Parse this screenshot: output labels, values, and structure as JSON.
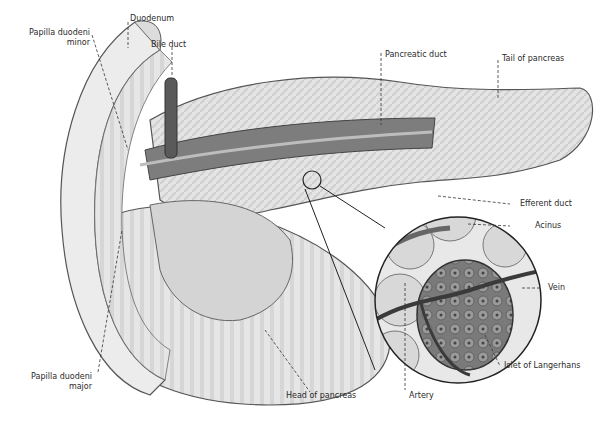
{
  "diagram": {
    "labels": {
      "duodenum": "Duodenum",
      "papilla_minor_line1": "Papilla duodeni",
      "papilla_minor_line2": "minor",
      "bile_duct": "Bile duct",
      "pancreatic_duct": "Pancreatic duct",
      "tail_of_pancreas": "Tail of pancreas",
      "efferent_duct": "Efferent duct",
      "acinus": "Acinus",
      "vein": "Vein",
      "islet_of_langerhans": "Islet of Langerhans",
      "artery": "Artery",
      "head_of_pancreas": "Head of pancreas",
      "papilla_major_line1": "Papilla duodeni",
      "papilla_major_line2": "major"
    },
    "colors": {
      "organ_fill": "#e2e2e2",
      "organ_stroke": "#555555",
      "duct_dark": "#6a6a6a",
      "leader_line": "#333333",
      "text": "#2a2a2a"
    }
  }
}
